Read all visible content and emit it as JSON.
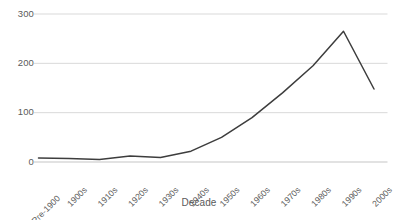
{
  "chart_data": {
    "type": "line",
    "title": "",
    "subtitle": "",
    "xlabel": "Decade",
    "ylabel": "",
    "categories": [
      "Pre-1900",
      "1900s",
      "1910s",
      "1920s",
      "1930s",
      "1940s",
      "1950s",
      "1960s",
      "1970s",
      "1980s",
      "1990s",
      "2000s"
    ],
    "values": [
      8,
      7,
      5,
      12,
      9,
      22,
      50,
      90,
      140,
      195,
      265,
      148
    ],
    "series": [
      {
        "name": "",
        "values": [
          8,
          7,
          5,
          12,
          9,
          22,
          50,
          90,
          140,
          195,
          265,
          148
        ]
      }
    ],
    "ylim": [
      0,
      300
    ],
    "yticks": [
      0,
      100,
      200,
      300
    ],
    "ytick_labels": [
      "0",
      "100",
      "200",
      "300"
    ],
    "grid": "horizontal",
    "legend": "none",
    "line_color": "#3d3d3d",
    "grid_color": "#d9d9d9",
    "axis_color": "#d9d9d9",
    "text_color": "#5a5a5a",
    "background": "#ffffff",
    "markers": "none",
    "xtick_rotation": -45
  },
  "axis": {
    "x_title": "Decade"
  }
}
